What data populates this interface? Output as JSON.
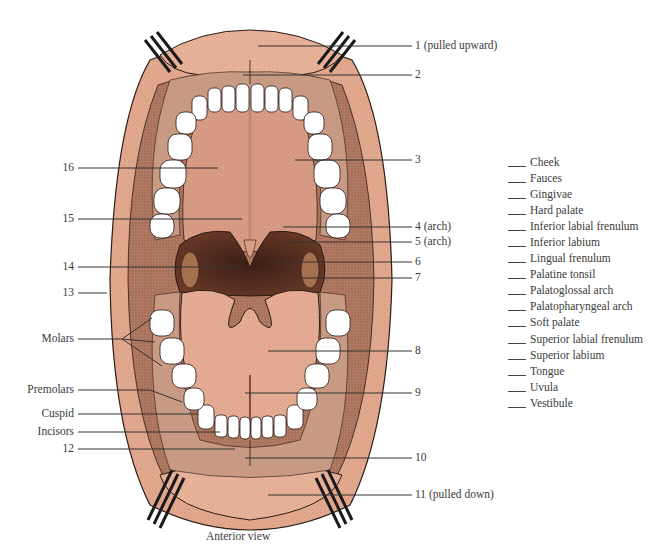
{
  "diagram": {
    "caption": "Anterior view",
    "colors": {
      "lip_skin": "#e3a98f",
      "lip_skin_light": "#efbfa6",
      "mucosa_dark": "#8a5a45",
      "pharynx_dark": "#4a2a1e",
      "palate": "#d99c84",
      "tongue": "#e6ad94",
      "teeth": "#ffffff",
      "outline": "#2a1a14",
      "retractor": "#2b2b2b",
      "leader_line": "#333333"
    },
    "right_labels": [
      {
        "id": "1",
        "text": "1 (pulled upward)",
        "y": 46
      },
      {
        "id": "2",
        "text": "2",
        "y": 75
      },
      {
        "id": "3",
        "text": "3",
        "y": 160
      },
      {
        "id": "4",
        "text": "4 (arch)",
        "y": 227
      },
      {
        "id": "5",
        "text": "5 (arch)",
        "y": 242
      },
      {
        "id": "6",
        "text": "6",
        "y": 262
      },
      {
        "id": "7",
        "text": "7",
        "y": 278
      },
      {
        "id": "8",
        "text": "8",
        "y": 351
      },
      {
        "id": "9",
        "text": "9",
        "y": 393
      },
      {
        "id": "10",
        "text": "10",
        "y": 458
      },
      {
        "id": "11",
        "text": "11 (pulled down)",
        "y": 495
      }
    ],
    "left_labels": [
      {
        "id": "16",
        "text": "16",
        "y": 168
      },
      {
        "id": "15",
        "text": "15",
        "y": 219
      },
      {
        "id": "14",
        "text": "14",
        "y": 267
      },
      {
        "id": "13",
        "text": "13",
        "y": 293
      },
      {
        "id": "molars",
        "text": "Molars",
        "y": 339
      },
      {
        "id": "premolars",
        "text": "Premolars",
        "y": 390
      },
      {
        "id": "cuspid",
        "text": "Cuspid",
        "y": 414
      },
      {
        "id": "incisors",
        "text": "Incisors",
        "y": 432
      },
      {
        "id": "12",
        "text": "12",
        "y": 449
      }
    ],
    "term_bank": [
      "Cheek",
      "Fauces",
      "Gingivae",
      "Hard palate",
      "Inferior labial frenulum",
      "Inferior labium",
      "Lingual frenulum",
      "Palatine tonsil",
      "Palatoglossal arch",
      "Palatopharyngeal arch",
      "Soft palate",
      "Superior labial frenulum",
      "Superior labium",
      "Tongue",
      "Uvula",
      "Vestibule"
    ]
  }
}
